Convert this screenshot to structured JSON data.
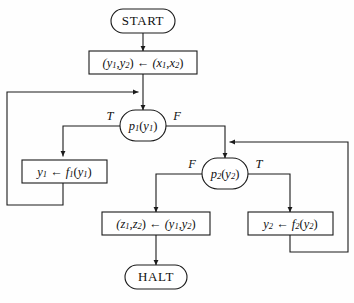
{
  "diagram": {
    "stroke_color": "#1a1a1a",
    "background_color": "#fefefe",
    "nodes": {
      "start": {
        "label": "START",
        "shape": "terminal"
      },
      "init": {
        "label": "(y1,y2) ← (x1,x2)",
        "shape": "process"
      },
      "p1": {
        "label": "p1(y1)",
        "shape": "decision"
      },
      "update1": {
        "label": "y1 ← f1(y1)",
        "shape": "process"
      },
      "p2": {
        "label": "p2(y2)",
        "shape": "decision"
      },
      "output": {
        "label": "(z1,z2) ← (y1,y2)",
        "shape": "process"
      },
      "update2": {
        "label": "y2 ← f2(y2)",
        "shape": "process"
      },
      "halt": {
        "label": "HALT",
        "shape": "terminal"
      }
    },
    "branch_labels": {
      "p1_true": "T",
      "p1_false": "F",
      "p2_false": "F",
      "p2_true": "T"
    },
    "edges": [
      {
        "from": "start",
        "to": "init",
        "label": ""
      },
      {
        "from": "init",
        "to": "p1",
        "label": ""
      },
      {
        "from": "p1",
        "to": "update1",
        "label": "T"
      },
      {
        "from": "p1",
        "to": "p2",
        "label": "F"
      },
      {
        "from": "update1",
        "to": "p1",
        "label": "loop-back-left"
      },
      {
        "from": "p2",
        "to": "output",
        "label": "F"
      },
      {
        "from": "p2",
        "to": "update2",
        "label": "T"
      },
      {
        "from": "update2",
        "to": "p2",
        "label": "loop-back-right"
      },
      {
        "from": "output",
        "to": "halt",
        "label": ""
      }
    ]
  }
}
